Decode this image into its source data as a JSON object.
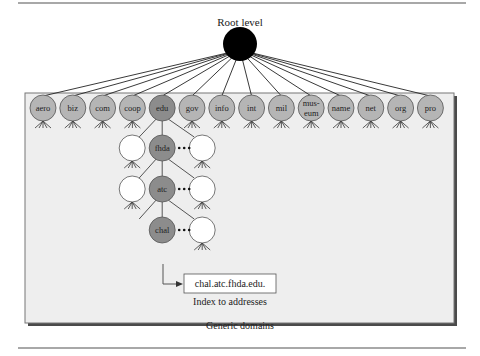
{
  "figure": {
    "root_label": "Root level",
    "frame_label": "Generic domains",
    "index_caption": "Index to addresses",
    "index_value": "chal.atc.fhda.edu.",
    "colors": {
      "root": "#000000",
      "generic_node": "#b5b5b5",
      "highlight_node": "#8c8c8c",
      "empty_node": "#ffffff",
      "frame_bg": "#eeeeee",
      "stroke": "#555555"
    }
  },
  "domains": [
    "aero",
    "biz",
    "com",
    "coop",
    "edu",
    "gov",
    "info",
    "int",
    "mil",
    "mus-\neum",
    "name",
    "net",
    "org",
    "pro"
  ],
  "highlight_domain": "edu",
  "chain": [
    "fhda",
    "atc",
    "chal"
  ]
}
